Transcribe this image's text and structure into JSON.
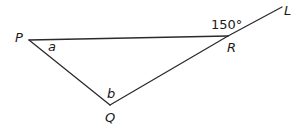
{
  "diagram": {
    "type": "triangle-exterior-angle",
    "vertices": {
      "P": {
        "label": "P"
      },
      "Q": {
        "label": "Q"
      },
      "R": {
        "label": "R"
      }
    },
    "line_end": {
      "label": "L"
    },
    "angles": {
      "at_P": "a",
      "at_Q": "b",
      "exterior_at_R": "150°"
    },
    "segments": [
      "PR",
      "PQ",
      "QR",
      "RL"
    ],
    "note": "Q, R and L are collinear; 150° is the exterior angle at R between RP and RL"
  }
}
